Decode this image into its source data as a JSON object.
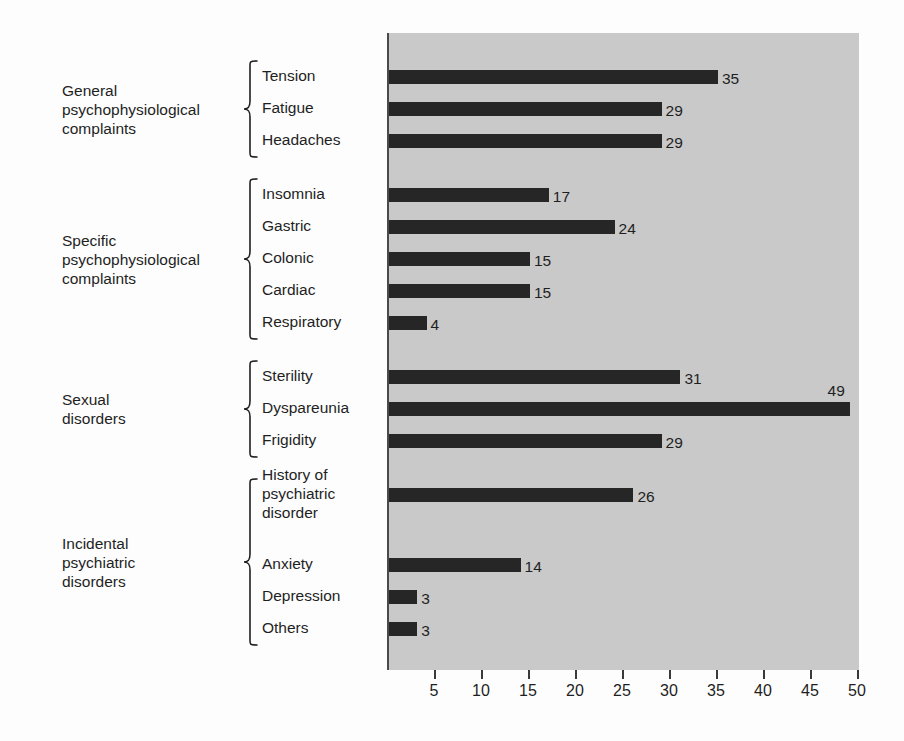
{
  "chart_data": {
    "type": "bar",
    "orientation": "horizontal",
    "title": "",
    "xlabel": "",
    "ylabel": "",
    "xlim": [
      0,
      50
    ],
    "xticks": [
      5,
      10,
      15,
      20,
      25,
      30,
      35,
      40,
      45,
      50
    ],
    "grid": false,
    "legend": "none",
    "bar_color": "#262626",
    "panel_color": "#c9c9c9",
    "categories": [
      "Tension",
      "Fatigue",
      "Headaches",
      "Insomnia",
      "Gastric",
      "Colonic",
      "Cardiac",
      "Respiratory",
      "Sterility",
      "Dyspareunia",
      "Frigidity",
      "History of psychiatric disorder",
      "Anxiety",
      "Depression",
      "Others"
    ],
    "values": [
      35,
      29,
      29,
      17,
      24,
      15,
      15,
      4,
      31,
      49,
      29,
      26,
      14,
      3,
      3
    ],
    "groups": [
      {
        "title": "General psychophysiological complaints",
        "title_lines": [
          "General",
          "psychophysiological",
          "complaints"
        ],
        "items": [
          {
            "label": "Tension",
            "label_lines": [
              "Tension"
            ],
            "value": 35
          },
          {
            "label": "Fatigue",
            "label_lines": [
              "Fatigue"
            ],
            "value": 29
          },
          {
            "label": "Headaches",
            "label_lines": [
              "Headaches"
            ],
            "value": 29
          }
        ]
      },
      {
        "title": "Specific psychophysiological complaints",
        "title_lines": [
          "Specific",
          "psychophysiological",
          "complaints"
        ],
        "items": [
          {
            "label": "Insomnia",
            "label_lines": [
              "Insomnia"
            ],
            "value": 17
          },
          {
            "label": "Gastric",
            "label_lines": [
              "Gastric"
            ],
            "value": 24
          },
          {
            "label": "Colonic",
            "label_lines": [
              "Colonic"
            ],
            "value": 15
          },
          {
            "label": "Cardiac",
            "label_lines": [
              "Cardiac"
            ],
            "value": 15
          },
          {
            "label": "Respiratory",
            "label_lines": [
              "Respiratory"
            ],
            "value": 4
          }
        ]
      },
      {
        "title": "Sexual disorders",
        "title_lines": [
          "Sexual",
          "disorders"
        ],
        "items": [
          {
            "label": "Sterility",
            "label_lines": [
              "Sterility"
            ],
            "value": 31
          },
          {
            "label": "Dyspareunia",
            "label_lines": [
              "Dyspareunia"
            ],
            "value": 49
          },
          {
            "label": "Frigidity",
            "label_lines": [
              "Frigidity"
            ],
            "value": 29
          }
        ]
      },
      {
        "title": "Incidental psychiatric disorders",
        "title_lines": [
          "Incidental",
          "psychiatric",
          "disorders"
        ],
        "items": [
          {
            "label": "History of psychiatric disorder",
            "label_lines": [
              "History of",
              "psychiatric",
              "disorder"
            ],
            "value": 26
          },
          {
            "label": "Anxiety",
            "label_lines": [
              "Anxiety"
            ],
            "value": 14
          },
          {
            "label": "Depression",
            "label_lines": [
              "Depression"
            ],
            "value": 3
          },
          {
            "label": "Others",
            "label_lines": [
              "Others"
            ],
            "value": 3
          }
        ]
      }
    ]
  }
}
